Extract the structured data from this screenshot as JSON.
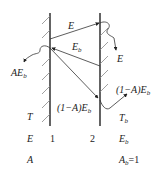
{
  "diagram": {
    "plates": [
      {
        "id": "1",
        "label": "1",
        "properties": {
          "T": "T",
          "E": "E",
          "A": "A"
        }
      },
      {
        "id": "2",
        "label": "2",
        "properties": {
          "T": "T_b",
          "E": "E_b",
          "A": "A_b=1"
        }
      }
    ],
    "row_labels": {
      "temperature": "T",
      "emissive_power": "E",
      "absorptivity": "A"
    },
    "plate2_props": {
      "temperature_main": "T",
      "temperature_sub": "b",
      "emissive_main": "E",
      "emissive_sub": "b",
      "absorptivity_main": "A",
      "absorptivity_sub": "b",
      "absorptivity_value": "=1"
    },
    "ray_labels": {
      "E_top": "E",
      "Eb_main": "E",
      "Eb_sub": "b",
      "absorbed_main": "AE",
      "absorbed_sub": "b",
      "absorbed_by_2": "E",
      "reflected_main": "(1−A)E",
      "reflected_sub": "b",
      "reflected2_main": "(1−A)E",
      "reflected2_sub": "b"
    }
  }
}
